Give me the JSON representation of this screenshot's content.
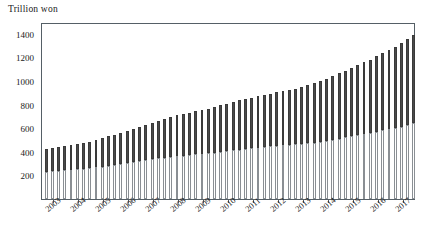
{
  "chart_data": {
    "type": "bar",
    "subtype": "stacked-bar",
    "title": "",
    "ylabel": "Trillion won",
    "xlabel": "",
    "ylim": [
      0,
      1500
    ],
    "yticks": [
      200,
      400,
      600,
      800,
      1000,
      1200,
      1400
    ],
    "grid": false,
    "legend": "none",
    "x_tick_labels": [
      "2003",
      "2004",
      "2005",
      "2006",
      "2007",
      "2008",
      "2009",
      "2010",
      "2011",
      "2012",
      "2013",
      "2014",
      "2015",
      "2016",
      "2017"
    ],
    "x_tick_rotation": -40,
    "frequency": "quarterly",
    "categories": [
      "2003Q1",
      "2003Q2",
      "2003Q3",
      "2003Q4",
      "2004Q1",
      "2004Q2",
      "2004Q3",
      "2004Q4",
      "2005Q1",
      "2005Q2",
      "2005Q3",
      "2005Q4",
      "2006Q1",
      "2006Q2",
      "2006Q3",
      "2006Q4",
      "2007Q1",
      "2007Q2",
      "2007Q3",
      "2007Q4",
      "2008Q1",
      "2008Q2",
      "2008Q3",
      "2008Q4",
      "2009Q1",
      "2009Q2",
      "2009Q3",
      "2009Q4",
      "2010Q1",
      "2010Q2",
      "2010Q3",
      "2010Q4",
      "2011Q1",
      "2011Q2",
      "2011Q3",
      "2011Q4",
      "2012Q1",
      "2012Q2",
      "2012Q3",
      "2012Q4",
      "2013Q1",
      "2013Q2",
      "2013Q3",
      "2013Q4",
      "2014Q1",
      "2014Q2",
      "2014Q3",
      "2014Q4",
      "2015Q1",
      "2015Q2",
      "2015Q3",
      "2015Q4",
      "2016Q1",
      "2016Q2",
      "2016Q3",
      "2016Q4",
      "2017Q1",
      "2017Q2",
      "2017Q3",
      "2017Q4"
    ],
    "series": [
      {
        "name": "lower-segment",
        "color": "#ffffff",
        "edge_color": "#8a8f94",
        "values": [
          230,
          235,
          240,
          245,
          250,
          255,
          258,
          262,
          268,
          275,
          282,
          290,
          298,
          306,
          314,
          322,
          330,
          338,
          344,
          350,
          356,
          362,
          368,
          374,
          378,
          382,
          388,
          394,
          400,
          406,
          412,
          418,
          424,
          430,
          436,
          442,
          446,
          450,
          454,
          458,
          462,
          466,
          472,
          478,
          486,
          494,
          502,
          512,
          522,
          532,
          542,
          552,
          562,
          572,
          582,
          592,
          602,
          614,
          626,
          640
        ]
      },
      {
        "name": "upper-segment",
        "color": "#4a4a4a",
        "edge_color": "#3a3a3a",
        "values": [
          190,
          195,
          200,
          205,
          208,
          212,
          218,
          224,
          232,
          240,
          248,
          256,
          264,
          272,
          280,
          290,
          300,
          310,
          320,
          330,
          338,
          346,
          352,
          358,
          364,
          370,
          378,
          386,
          394,
          402,
          410,
          418,
          424,
          430,
          436,
          442,
          448,
          454,
          460,
          466,
          474,
          482,
          492,
          502,
          514,
          526,
          540,
          554,
          566,
          578,
          592,
          606,
          620,
          636,
          652,
          668,
          686,
          706,
          726,
          750
        ]
      }
    ],
    "totals": [
      420,
      430,
      440,
      450,
      458,
      467,
      476,
      486,
      500,
      515,
      530,
      546,
      562,
      578,
      594,
      612,
      630,
      648,
      664,
      680,
      694,
      708,
      720,
      732,
      742,
      752,
      766,
      780,
      794,
      808,
      822,
      836,
      848,
      860,
      872,
      884,
      894,
      904,
      914,
      924,
      936,
      948,
      964,
      980,
      1000,
      1020,
      1042,
      1066,
      1088,
      1110,
      1134,
      1158,
      1182,
      1208,
      1234,
      1260,
      1288,
      1320,
      1352,
      1390
    ]
  },
  "axis": {
    "y_label_text": "Trillion won",
    "y_tick_texts": [
      "1400",
      "1200",
      "1000",
      "800",
      "600",
      "400",
      "200"
    ],
    "x_tick_texts": [
      "2003",
      "2004",
      "2005",
      "2006",
      "2007",
      "2008",
      "2009",
      "2010",
      "2011",
      "2012",
      "2013",
      "2014",
      "2015",
      "2016",
      "2017"
    ]
  },
  "colors": {
    "axis_line": "#555f66",
    "upper_segment": "#4a4a4a",
    "lower_segment": "#ffffff",
    "segment_edge": "#8a8f94",
    "text": "#1a1a1a",
    "background": "#ffffff"
  }
}
